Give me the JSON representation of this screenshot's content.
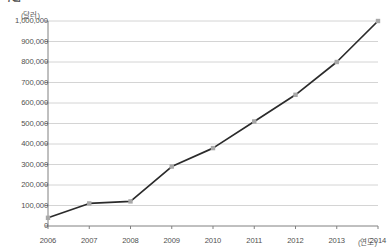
{
  "caption_fragment": "그림",
  "axis": {
    "y_unit": "(달러)",
    "x_unit": "(연도)",
    "y_ticks": [
      "0",
      "100,000",
      "200,000",
      "300,000",
      "400,000",
      "500,000",
      "600,000",
      "700,000",
      "800,000",
      "900,000",
      "1,000,000"
    ],
    "x_ticks": [
      "2006",
      "2007",
      "2008",
      "2009",
      "2010",
      "2011",
      "2012",
      "2013",
      "2014"
    ]
  },
  "colors": {
    "line": "#2b2b2b",
    "marker": "#a8a8a8",
    "grid": "#c9c9c9",
    "axis": "#808080",
    "text": "#4f4f4f"
  },
  "chart_data": {
    "type": "line",
    "title": "",
    "xlabel": "(연도)",
    "ylabel": "(달러)",
    "x": [
      2006,
      2007,
      2008,
      2009,
      2010,
      2011,
      2012,
      2013,
      2014
    ],
    "categories": [
      "2006",
      "2007",
      "2008",
      "2009",
      "2010",
      "2011",
      "2012",
      "2013",
      "2014"
    ],
    "values": [
      40000,
      110000,
      120000,
      290000,
      380000,
      510000,
      640000,
      800000,
      1000000
    ],
    "series": [
      {
        "name": "값",
        "values": [
          40000,
          110000,
          120000,
          290000,
          380000,
          510000,
          640000,
          800000,
          1000000
        ]
      }
    ],
    "ylim": [
      0,
      1000000
    ],
    "ytick_step": 100000,
    "xlim": [
      2006,
      2014
    ],
    "grid": "horizontal",
    "legend": "none",
    "markers": true
  }
}
